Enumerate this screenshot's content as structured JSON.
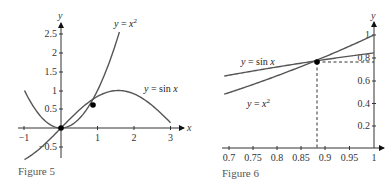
{
  "chart_data": [
    {
      "type": "line",
      "caption": "Figure 5",
      "xlabel": "x",
      "ylabel": "y",
      "xlim": [
        -1.1,
        3.3
      ],
      "ylim": [
        -0.6,
        2.75
      ],
      "x_ticks": [
        "−1",
        "1",
        "2",
        "3"
      ],
      "y_ticks": [
        "−0.5",
        "0.5",
        "1",
        "1.5",
        "2",
        "2.5"
      ],
      "series": [
        {
          "name": "y = x²",
          "label": "y = x",
          "sup": "2",
          "x_range": [
            -1,
            1.6
          ]
        },
        {
          "name": "y = sin x",
          "label": "y = sin x",
          "x_range": [
            -1,
            3
          ]
        }
      ],
      "points": [
        {
          "x": 0,
          "y": 0
        },
        {
          "x": 0.877,
          "y": 0.769
        }
      ]
    },
    {
      "type": "line",
      "caption": "Figure 6",
      "xlabel": "",
      "ylabel": "y",
      "xlim": [
        0.69,
        1.02
      ],
      "ylim": [
        0,
        1.05
      ],
      "x_ticks": [
        "0.7",
        "0.75",
        "0.8",
        "0.85",
        "0.9",
        "0.95",
        "1"
      ],
      "y_ticks": [
        "0.2",
        "0.4",
        "0.6",
        "0.8",
        "1"
      ],
      "series": [
        {
          "name": "y = sin x",
          "label": "y = sin x",
          "x_range": [
            0.69,
            1
          ]
        },
        {
          "name": "y = x²",
          "label": "y = x",
          "sup": "2",
          "x_range": [
            0.69,
            1
          ]
        }
      ],
      "points": [
        {
          "x": 0.877,
          "y": 0.769
        }
      ],
      "guides": {
        "vertical_x": 0.877,
        "horizontal_y": 0.769
      }
    }
  ],
  "fig5": {
    "caption": "Figure 5",
    "x_axis_label": "x",
    "y_axis_label": "y",
    "x_ticks": [
      "−1",
      "1",
      "2",
      "3"
    ],
    "y_ticks": [
      "−0.5",
      "0.5",
      "1",
      "1.5",
      "2",
      "2.5"
    ],
    "label_x2": "y = x",
    "label_x2_sup": "2",
    "label_sin": "y = sin x"
  },
  "fig6": {
    "caption": "Figure 6",
    "y_axis_label": "y",
    "x_ticks": [
      "0.7",
      "0.75",
      "0.8",
      "0.85",
      "0.9",
      "0.95",
      "1"
    ],
    "y_ticks": [
      "0.2",
      "0.4",
      "0.6",
      "0.8",
      "1"
    ],
    "label_sin": "y = sin x",
    "label_x2": "y = x",
    "label_x2_sup": "2"
  }
}
